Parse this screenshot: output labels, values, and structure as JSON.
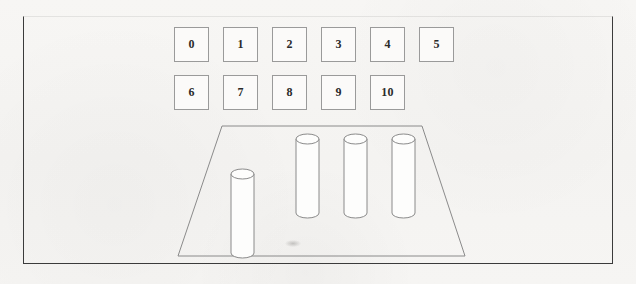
{
  "scene": {
    "title": "Blocks world scene with numbered tiles and cylinders",
    "background_color": "#f6f5f3",
    "line_color": "#8a8a8a",
    "frame_color": "#3b3b3b",
    "width": 636,
    "height": 284
  },
  "frame": {
    "name": "outer-frame",
    "left": 23,
    "top": 16,
    "width": 590,
    "height": 248
  },
  "tiles": {
    "rows": [
      {
        "row_index": 0,
        "top": 27,
        "items": [
          {
            "label": "0",
            "left": 174
          },
          {
            "label": "1",
            "left": 223
          },
          {
            "label": "2",
            "left": 272
          },
          {
            "label": "3",
            "left": 321
          },
          {
            "label": "4",
            "left": 370
          },
          {
            "label": "5",
            "left": 419
          }
        ]
      },
      {
        "row_index": 1,
        "top": 75,
        "items": [
          {
            "label": "6",
            "left": 174
          },
          {
            "label": "7",
            "left": 223
          },
          {
            "label": "8",
            "left": 272
          },
          {
            "label": "9",
            "left": 321
          },
          {
            "label": "10",
            "left": 370
          }
        ]
      }
    ],
    "size": 35,
    "border_color": "#9a9a9a",
    "fill_color": "#fbfaf9"
  },
  "platform": {
    "name": "trapezoid-floor",
    "shape": "trapezoid",
    "points": "222,126 422,126 465,256 178,256",
    "stroke": "#8a8a8a",
    "fill": "none"
  },
  "cylinders": [
    {
      "name": "cylinder-1",
      "left": 230,
      "top": 168,
      "width": 23,
      "height": 84,
      "ellipse_ry": 5
    },
    {
      "name": "cylinder-2",
      "left": 295,
      "top": 133,
      "width": 23,
      "height": 79,
      "ellipse_ry": 5
    },
    {
      "name": "cylinder-3",
      "left": 343,
      "top": 133,
      "width": 23,
      "height": 79,
      "ellipse_ry": 5
    },
    {
      "name": "cylinder-4",
      "left": 391,
      "top": 133,
      "width": 23,
      "height": 79,
      "ellipse_ry": 5
    }
  ],
  "smudge": {
    "name": "floor-smudge",
    "left": 285,
    "top": 240
  }
}
